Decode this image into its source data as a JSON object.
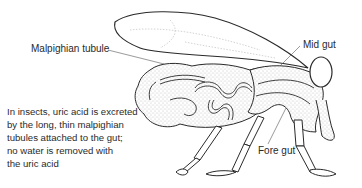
{
  "diagram": {
    "labels": {
      "malpighian_tubule": "Malpighian tubule",
      "mid_gut": "Mid gut",
      "fore_gut": "Fore gut"
    },
    "caption_lines": [
      "In insects, uric acid is excreted",
      "by the long, thin malpighian",
      "tubules attached to the gut;",
      "no water is removed with",
      "the uric acid"
    ],
    "colors": {
      "ink": "#2a2a2a",
      "stipple": "#9a9a9a",
      "background": "#ffffff"
    }
  }
}
